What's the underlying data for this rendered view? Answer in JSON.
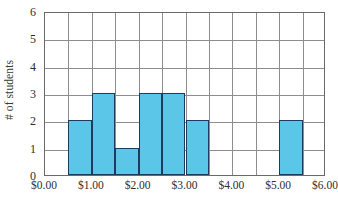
{
  "chart_data": {
    "type": "bar",
    "title": "",
    "subtitle": "",
    "xlabel": "",
    "ylabel": "# of students",
    "xlim": [
      0,
      6
    ],
    "ylim": [
      0,
      6
    ],
    "bin_width": 0.5,
    "grid": true,
    "legend": null,
    "x_tick_labels": [
      "$0.00",
      "$1.00",
      "$2.00",
      "$3.00",
      "$4.00",
      "$5.00",
      "$6.00"
    ],
    "x_tick_values": [
      0,
      1,
      2,
      3,
      4,
      5,
      6
    ],
    "y_tick_labels": [
      "0",
      "1",
      "2",
      "3",
      "4",
      "5",
      "6"
    ],
    "y_tick_values": [
      0,
      1,
      2,
      3,
      4,
      5,
      6
    ],
    "bar_fill_color": "#5cc6e8",
    "bar_border_color": "#1f3a5f",
    "grid_color": "#8d8d8d",
    "axis_color": "#6a6a6a",
    "bins": [
      {
        "start": 0.0,
        "end": 0.5,
        "value": 0
      },
      {
        "start": 0.5,
        "end": 1.0,
        "value": 2
      },
      {
        "start": 1.0,
        "end": 1.5,
        "value": 3
      },
      {
        "start": 1.5,
        "end": 2.0,
        "value": 1
      },
      {
        "start": 2.0,
        "end": 2.5,
        "value": 3
      },
      {
        "start": 2.5,
        "end": 3.0,
        "value": 3
      },
      {
        "start": 3.0,
        "end": 3.5,
        "value": 2
      },
      {
        "start": 3.5,
        "end": 4.0,
        "value": 0
      },
      {
        "start": 4.0,
        "end": 4.5,
        "value": 0
      },
      {
        "start": 4.5,
        "end": 5.0,
        "value": 0
      },
      {
        "start": 5.0,
        "end": 5.5,
        "value": 2
      },
      {
        "start": 5.5,
        "end": 6.0,
        "value": 0
      }
    ],
    "categories": [
      "$0.00-$0.50",
      "$0.50-$1.00",
      "$1.00-$1.50",
      "$1.50-$2.00",
      "$2.00-$2.50",
      "$2.50-$3.00",
      "$3.00-$3.50",
      "$3.50-$4.00",
      "$4.00-$4.50",
      "$4.50-$5.00",
      "$5.00-$5.50",
      "$5.50-$6.00"
    ],
    "values": [
      0,
      2,
      3,
      1,
      3,
      3,
      2,
      0,
      0,
      0,
      2,
      0
    ]
  }
}
